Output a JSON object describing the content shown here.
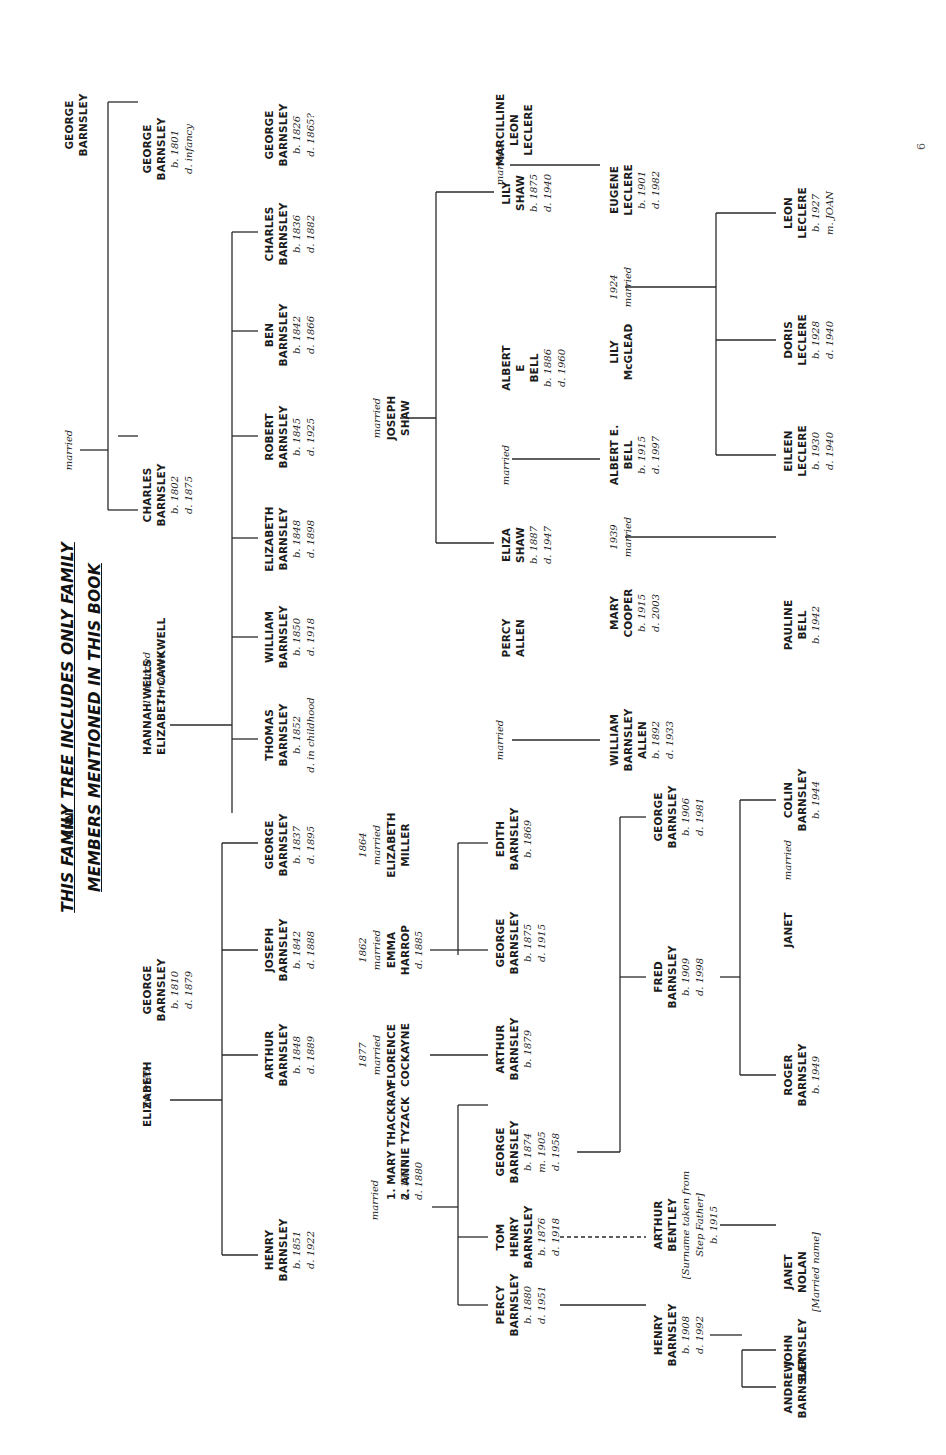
{
  "title": {
    "line1": "THIS FAMILY TREE INCLUDES ONLY FAMILY",
    "line2": "MEMBERS MENTIONED IN THIS BOOK"
  },
  "page_number": "6",
  "people": {
    "george_sr": {
      "lines": [
        "GEORGE",
        "BARNSLEY"
      ],
      "dates": []
    },
    "ann": {
      "lines": [
        "ANN"
      ],
      "dates": []
    },
    "george_1801": {
      "lines": [
        "GEORGE",
        "BARNSLEY"
      ],
      "dates": [
        "b. 1801",
        "d. infancy"
      ]
    },
    "charles_1802": {
      "lines": [
        "CHARLES",
        "BARNSLEY"
      ],
      "dates": [
        "b. 1802",
        "d. 1875"
      ]
    },
    "hannah_wells": {
      "lines": [
        "HANNAH WELLS"
      ],
      "dates": []
    },
    "elizabeth_cawkwell": {
      "lines": [
        "ELIZABETH CAWKWELL"
      ],
      "dates": []
    },
    "george_1810": {
      "lines": [
        "GEORGE",
        "BARNSLEY"
      ],
      "dates": [
        "b. 1810",
        "d. 1879"
      ]
    },
    "elizabeth_wife": {
      "lines": [
        "ELIZABETH"
      ],
      "dates": []
    },
    "george_1826": {
      "lines": [
        "GEORGE",
        "BARNSLEY"
      ],
      "dates": [
        "b. 1826",
        "d. 1865?"
      ]
    },
    "charles_1836": {
      "lines": [
        "CHARLES",
        "BARNSLEY"
      ],
      "dates": [
        "b. 1836",
        "d. 1882"
      ]
    },
    "ben_1842": {
      "lines": [
        "BEN",
        "BARNSLEY"
      ],
      "dates": [
        "b. 1842",
        "d. 1866"
      ]
    },
    "robert_1845": {
      "lines": [
        "ROBERT",
        "BARNSLEY"
      ],
      "dates": [
        "b. 1845",
        "d. 1925"
      ]
    },
    "elizabeth_1848": {
      "lines": [
        "ELIZABETH",
        "BARNSLEY"
      ],
      "dates": [
        "b. 1848",
        "d. 1898"
      ]
    },
    "william_1850": {
      "lines": [
        "WILLIAM",
        "BARNSLEY"
      ],
      "dates": [
        "b. 1850",
        "d. 1918"
      ]
    },
    "thomas_1852": {
      "lines": [
        "THOMAS",
        "BARNSLEY"
      ],
      "dates": [
        "b. 1852",
        "d. in childhood"
      ]
    },
    "george_1837": {
      "lines": [
        "GEORGE",
        "BARNSLEY"
      ],
      "dates": [
        "b. 1837",
        "d. 1895"
      ]
    },
    "joseph_1842": {
      "lines": [
        "JOSEPH",
        "BARNSLEY"
      ],
      "dates": [
        "b. 1842",
        "d. 1888"
      ]
    },
    "arthur_1848": {
      "lines": [
        "ARTHUR",
        "BARNSLEY"
      ],
      "dates": [
        "b. 1848",
        "d. 1889"
      ]
    },
    "henry_1851": {
      "lines": [
        "HENRY",
        "BARNSLEY"
      ],
      "dates": [
        "b. 1851",
        "d. 1922"
      ]
    },
    "elizabeth_miller": {
      "lines": [
        "ELIZABETH",
        "MILLER"
      ],
      "dates": []
    },
    "emma_harrop": {
      "lines": [
        "EMMA",
        "HARROP"
      ],
      "dates": [
        "d. 1885"
      ]
    },
    "florence_cockayne": {
      "lines": [
        "FLORENCE",
        "COCKAYNE"
      ],
      "dates": []
    },
    "mary_thackray": {
      "lines": [
        "1. MARY THACKRAY"
      ],
      "dates": [
        "d. 1877"
      ]
    },
    "annie_tyzack": {
      "lines": [
        "2. ANNIE TYZACK"
      ],
      "dates": [
        "d. 1880"
      ]
    },
    "joseph_shaw": {
      "lines": [
        "JOSEPH",
        "SHAW"
      ],
      "dates": []
    },
    "marcilline": {
      "lines": [
        "MARCILLINE",
        "LEON",
        "LECLERE"
      ],
      "dates": []
    },
    "lily_shaw": {
      "lines": [
        "LILY",
        "SHAW"
      ],
      "dates": [
        "b. 1875",
        "d. 1940"
      ]
    },
    "albert_e_bell_1886": {
      "lines": [
        "ALBERT",
        "E",
        "BELL"
      ],
      "dates": [
        "b. 1886",
        "d. 1960"
      ]
    },
    "eliza_shaw": {
      "lines": [
        "ELIZA",
        "SHAW"
      ],
      "dates": [
        "b. 1887",
        "d. 1947"
      ]
    },
    "percy_allen": {
      "lines": [
        "PERCY",
        "ALLEN"
      ],
      "dates": []
    },
    "edith_1869": {
      "lines": [
        "EDITH",
        "BARNSLEY"
      ],
      "dates": [
        "b. 1869"
      ]
    },
    "george_1875": {
      "lines": [
        "GEORGE",
        "BARNSLEY"
      ],
      "dates": [
        "b. 1875",
        "d. 1915"
      ]
    },
    "arthur_1879": {
      "lines": [
        "ARTHUR",
        "BARNSLEY"
      ],
      "dates": [
        "b. 1879"
      ]
    },
    "george_1874": {
      "lines": [
        "GEORGE",
        "BARNSLEY"
      ],
      "dates": [
        "b. 1874",
        "m. 1905",
        "d. 1958"
      ]
    },
    "tom_henry_1876": {
      "lines": [
        "TOM",
        "HENRY",
        "BARNSLEY"
      ],
      "dates": [
        "b. 1876",
        "d. 1918"
      ]
    },
    "percy_1880": {
      "lines": [
        "PERCY",
        "BARNSLEY"
      ],
      "dates": [
        "b. 1880",
        "d. 1951"
      ]
    },
    "eugene_leclere": {
      "lines": [
        "EUGENE",
        "LECLERE"
      ],
      "dates": [
        "b. 1901",
        "d. 1982"
      ]
    },
    "lily_mcglead": {
      "lines": [
        "LILY",
        "McGLEAD"
      ],
      "dates": []
    },
    "albert_e_bell_1915": {
      "lines": [
        "ALBERT E.",
        "BELL"
      ],
      "dates": [
        "b. 1915",
        "d. 1997"
      ]
    },
    "mary_cooper": {
      "lines": [
        "MARY",
        "COOPER"
      ],
      "dates": [
        "b. 1915",
        "d. 2003"
      ]
    },
    "william_allen": {
      "lines": [
        "WILLIAM",
        "BARNSLEY",
        "ALLEN"
      ],
      "dates": [
        "b. 1892",
        "d. 1933"
      ]
    },
    "george_1906": {
      "lines": [
        "GEORGE",
        "BARNSLEY"
      ],
      "dates": [
        "b. 1906",
        "d. 1981"
      ]
    },
    "fred_1909": {
      "lines": [
        "FRED",
        "BARNSLEY"
      ],
      "dates": [
        "b. 1909",
        "d. 1998"
      ]
    },
    "arthur_bentley": {
      "lines": [
        "ARTHUR",
        "BENTLEY"
      ],
      "dates": [
        "[Surname taken from",
        "Step Father]",
        "b. 1915"
      ]
    },
    "henry_1908": {
      "lines": [
        "HENRY",
        "BARNSLEY"
      ],
      "dates": [
        "b. 1908",
        "d. 1992"
      ]
    },
    "leon_leclere": {
      "lines": [
        "LEON",
        "LECLERE"
      ],
      "dates": [
        "b. 1927",
        "m. JOAN"
      ]
    },
    "doris_leclere": {
      "lines": [
        "DORIS",
        "LECLERE"
      ],
      "dates": [
        "b. 1928",
        "d. 1940"
      ]
    },
    "eileen_leclere": {
      "lines": [
        "EILEEN",
        "LECLERE"
      ],
      "dates": [
        "b. 1930",
        "d. 1940"
      ]
    },
    "pauline_bell": {
      "lines": [
        "PAULINE",
        "BELL"
      ],
      "dates": [
        "b. 1942"
      ]
    },
    "colin_1944": {
      "lines": [
        "COLIN",
        "BARNSLEY"
      ],
      "dates": [
        "b. 1944"
      ]
    },
    "janet": {
      "lines": [
        "JANET"
      ],
      "dates": []
    },
    "roger_1949": {
      "lines": [
        "ROGER",
        "BARNSLEY"
      ],
      "dates": [
        "b. 1949"
      ]
    },
    "janet_nolan": {
      "lines": [
        "JANET",
        "NOLAN"
      ],
      "dates": [
        "[Married name]"
      ]
    },
    "john_barnsley": {
      "lines": [
        "JOHN",
        "BARNSLEY"
      ],
      "dates": []
    },
    "andrew_barnsley": {
      "lines": [
        "ANDREW",
        "BARNSLEY"
      ],
      "dates": []
    }
  },
  "marriage_labels": {
    "george_ann": [
      "married"
    ],
    "charles_wives": [
      "1. married",
      "2. married"
    ],
    "george_elizabeth": [
      "married"
    ],
    "george_miller": [
      "1864",
      "married"
    ],
    "joseph_harrop": [
      "1862",
      "married"
    ],
    "arthur_cockayne": [
      "1877",
      "married"
    ],
    "henry_wives": [
      "married"
    ],
    "joseph_shaw": [
      "married"
    ],
    "marcilline_lily": [
      "married"
    ],
    "albert_eliza": [
      "married"
    ],
    "percy_edith": [
      "married"
    ],
    "eugene_lily": [
      "1924",
      "married"
    ],
    "albert_mary": [
      "1939",
      "married"
    ],
    "colin_janet": [
      "married"
    ]
  }
}
